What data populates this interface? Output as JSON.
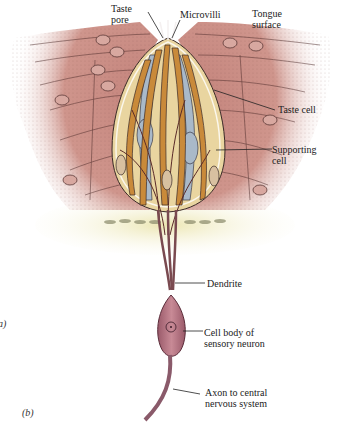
{
  "figure": {
    "panel_labels": {
      "a_partial": "a)",
      "b": "(b)"
    },
    "labels": {
      "taste_pore": [
        "Taste",
        "pore"
      ],
      "microvilli": [
        "Microvilli"
      ],
      "tongue_surface": [
        "Tongue",
        "surface"
      ],
      "taste_cell": [
        "Taste cell"
      ],
      "supporting_cell": [
        "Supporting",
        "cell"
      ],
      "dendrite": [
        "Dendrite"
      ],
      "cell_body": [
        "Cell body of",
        "sensory neuron"
      ],
      "axon": [
        "Axon to central",
        "nervous system"
      ]
    },
    "colors": {
      "epithelium": "#c98c84",
      "epithelium_dark": "#a86a64",
      "bud_fill": "#e8d4a0",
      "taste_cell": "#c98a3a",
      "supporting_blue": "#a8b8c8",
      "neuron": "#b07080",
      "connective": "#ece8b8",
      "line": "#3a2a28"
    }
  }
}
